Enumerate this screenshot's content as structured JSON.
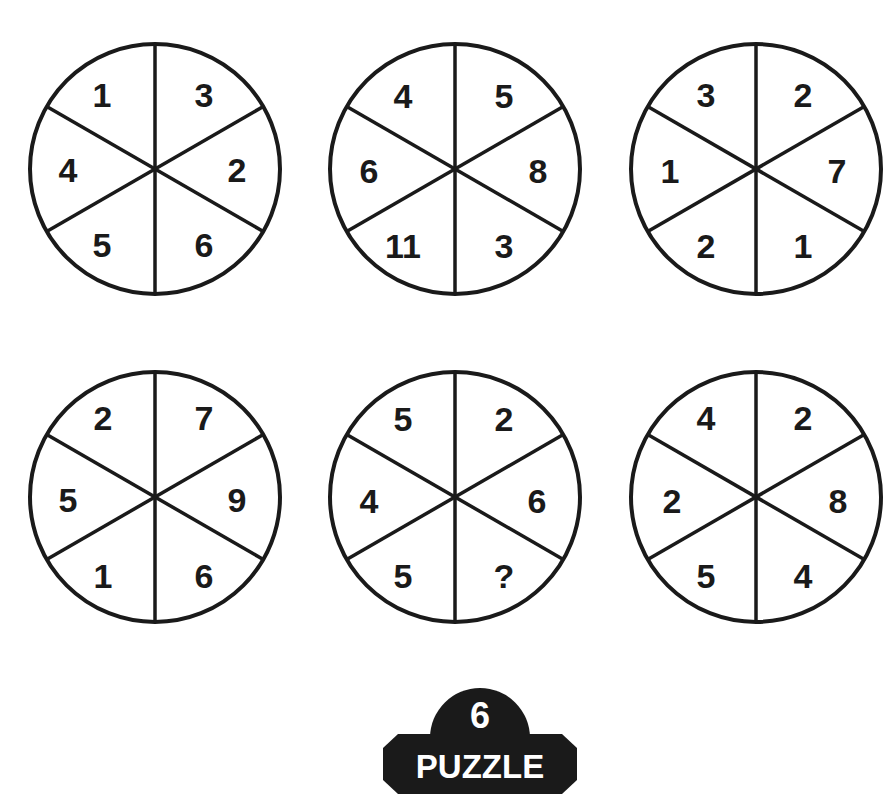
{
  "puzzle": {
    "number": "6",
    "label": "PUZZLE",
    "badge_color": "#1a1a1a",
    "line_color": "#1a1a1a"
  },
  "wheels": [
    {
      "position": "top-left",
      "segments": {
        "top_left": "1",
        "top_right": "3",
        "right": "2",
        "bottom_right": "6",
        "bottom_left": "5",
        "left": "4"
      }
    },
    {
      "position": "top-center",
      "segments": {
        "top_left": "4",
        "top_right": "5",
        "right": "8",
        "bottom_right": "3",
        "bottom_left": "11",
        "left": "6"
      }
    },
    {
      "position": "top-right",
      "segments": {
        "top_left": "3",
        "top_right": "2",
        "right": "7",
        "bottom_right": "1",
        "bottom_left": "2",
        "left": "1"
      }
    },
    {
      "position": "bottom-left",
      "segments": {
        "top_left": "2",
        "top_right": "7",
        "right": "9",
        "bottom_right": "6",
        "bottom_left": "1",
        "left": "5"
      }
    },
    {
      "position": "bottom-center",
      "segments": {
        "top_left": "5",
        "top_right": "2",
        "right": "6",
        "bottom_right": "?",
        "bottom_left": "5",
        "left": "4"
      }
    },
    {
      "position": "bottom-right",
      "segments": {
        "top_left": "4",
        "top_right": "2",
        "right": "8",
        "bottom_right": "4",
        "bottom_left": "5",
        "left": "2"
      }
    }
  ]
}
